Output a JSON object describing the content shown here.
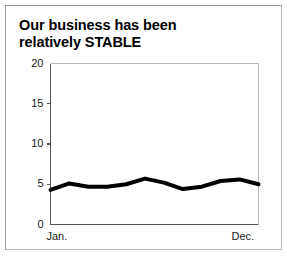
{
  "figure": {
    "title_lines": [
      "Our business has been",
      "relatively STABLE"
    ],
    "background_color": "#ffffff",
    "frame_color": "#9a9a9a"
  },
  "chart_data": {
    "type": "line",
    "title": "Our business has been relatively STABLE",
    "xlabel": "",
    "ylabel": "",
    "grid": false,
    "legend": null,
    "line_color": "#000000",
    "line_width": 4,
    "axis_color": "#555555",
    "ylim": [
      0,
      20
    ],
    "yticks": [
      0,
      5,
      10,
      15,
      20
    ],
    "ytick_labels": [
      "0",
      "5",
      "10",
      "15",
      "20"
    ],
    "x": [
      "Jan.",
      "Feb.",
      "Mar.",
      "Apr.",
      "May",
      "Jun.",
      "Jul.",
      "Aug.",
      "Sep.",
      "Oct.",
      "Nov.",
      "Dec."
    ],
    "xtick_labels": [
      "Jan.",
      "Dec."
    ],
    "xtick_positions": [
      0,
      11
    ],
    "values": [
      4.3,
      5.1,
      4.7,
      4.7,
      5.0,
      5.7,
      5.2,
      4.4,
      4.7,
      5.4,
      5.6,
      5.0
    ]
  }
}
